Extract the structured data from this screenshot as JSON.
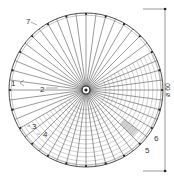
{
  "diagram": {
    "center": {
      "x": 86,
      "y": 90
    },
    "outer_radius": 77,
    "spoke_count": 48,
    "colors": {
      "line": "#3a3a3a",
      "spoke": "#555555",
      "ring": "#8a8a8a",
      "hatch": "#9a9a9a",
      "label": "#333333"
    },
    "callouts": [
      {
        "id": "1",
        "text": "1",
        "x": 14,
        "y": 83
      },
      {
        "id": "2",
        "text": "2",
        "x": 41,
        "y": 90
      },
      {
        "id": "3",
        "text": "3",
        "x": 34,
        "y": 129
      },
      {
        "id": "4",
        "text": "4",
        "x": 45,
        "y": 137
      },
      {
        "id": "5",
        "text": "5",
        "x": 148,
        "y": 152
      },
      {
        "id": "6",
        "text": "6",
        "x": 152,
        "y": 139
      },
      {
        "id": "7",
        "text": "7",
        "x": 29,
        "y": 21
      }
    ],
    "dimension": {
      "label": "ø 60",
      "orientation": "vertical"
    }
  }
}
